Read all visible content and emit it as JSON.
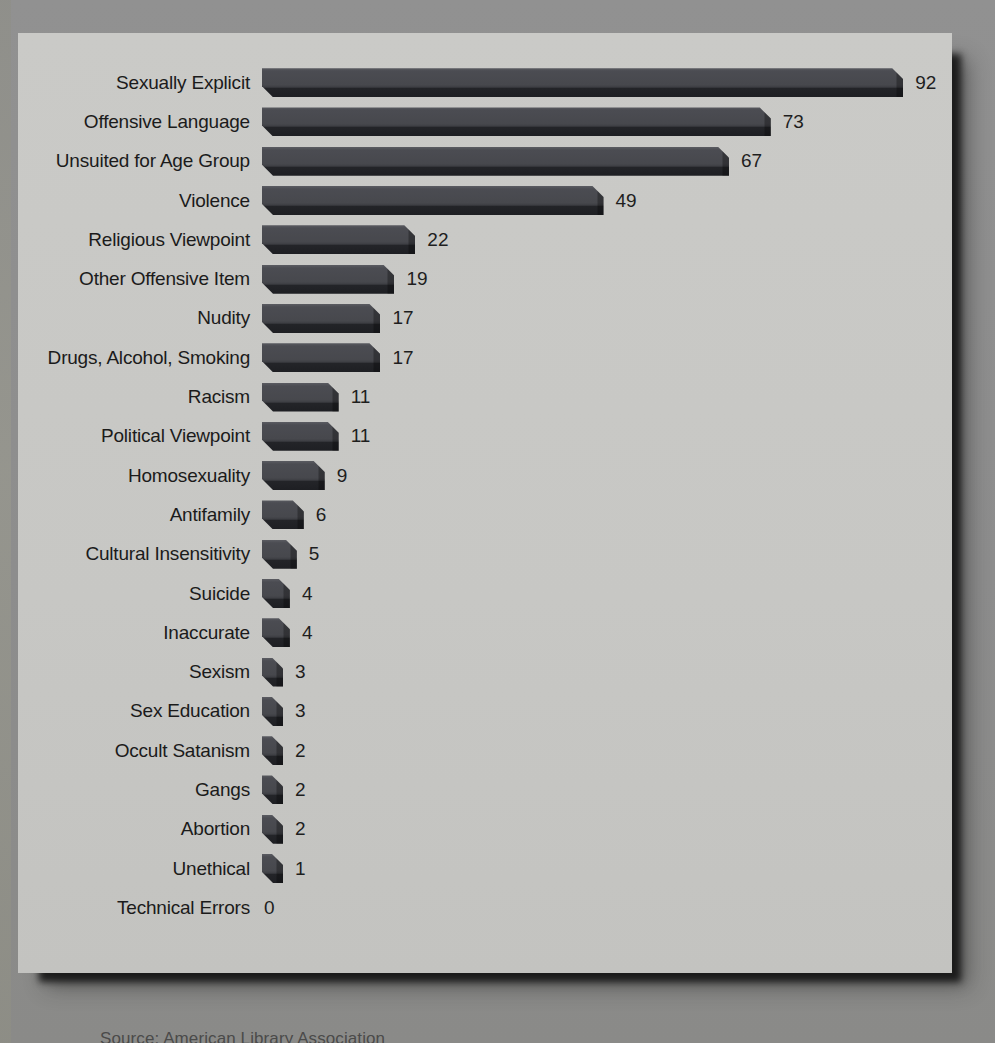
{
  "chart_data": {
    "type": "bar",
    "orientation": "horizontal",
    "title": "",
    "xlabel": "",
    "ylabel": "",
    "categories": [
      "Sexually Explicit",
      "Offensive Language",
      "Unsuited for Age Group",
      "Violence",
      "Religious Viewpoint",
      "Other Offensive Item",
      "Nudity",
      "Drugs, Alcohol, Smoking",
      "Racism",
      "Political Viewpoint",
      "Homosexuality",
      "Antifamily",
      "Cultural Insensitivity",
      "Suicide",
      "Inaccurate",
      "Sexism",
      "Sex Education",
      "Occult Satanism",
      "Gangs",
      "Abortion",
      "Unethical",
      "Technical Errors"
    ],
    "values": [
      92,
      73,
      67,
      49,
      22,
      19,
      17,
      17,
      11,
      11,
      9,
      6,
      5,
      4,
      4,
      3,
      3,
      2,
      2,
      2,
      1,
      0
    ],
    "value_labels_shown": true,
    "axes_shown": false,
    "grid": false,
    "legend": null,
    "xlim": [
      0,
      96
    ],
    "colors": {
      "bar_face": "#47484d",
      "bar_shadow_edge": "#1e1f23",
      "panel_background": "#c7c7c4",
      "page_background": "#8e8e8e",
      "label_text": "#1b1b1b"
    },
    "style": "3d-beveled-bars, scanned print"
  },
  "source_note": "Source: American Library Association",
  "pixels_per_unit": 6.97
}
